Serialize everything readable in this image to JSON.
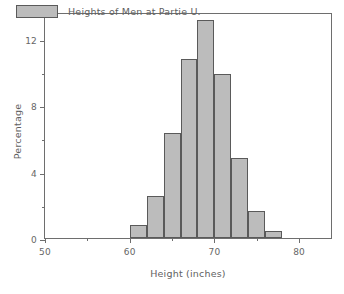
{
  "chart_data": {
    "type": "bar",
    "title": "",
    "subtitle": "",
    "xlabel": "Height (inches)",
    "ylabel": "Percentage",
    "xlim": [
      50,
      84
    ],
    "ylim": [
      0,
      13.6
    ],
    "grid": false,
    "legend_position": "top-left",
    "legend": [
      {
        "label": "Heights of Men at Partie U.",
        "color": "#bcbcbc"
      }
    ],
    "histogram": {
      "bin_width": 2,
      "bin_edges": [
        60,
        62,
        64,
        66,
        68,
        70,
        72,
        74,
        76,
        78
      ],
      "bin_centers": [
        61,
        63,
        65,
        67,
        69,
        71,
        73,
        75,
        77
      ]
    },
    "categories": [
      "60-62",
      "62-64",
      "64-66",
      "66-68",
      "68-70",
      "70-72",
      "72-74",
      "74-76",
      "76-78"
    ],
    "values": [
      0.8,
      2.5,
      6.3,
      10.8,
      13.1,
      9.9,
      4.8,
      1.6,
      0.4
    ],
    "x_ticks_major": [
      50,
      60,
      70,
      80
    ],
    "x_ticks_minor": [
      55,
      65,
      75
    ],
    "y_ticks_major": [
      0,
      4,
      8,
      12
    ],
    "y_ticks_minor": [
      2,
      6,
      10
    ],
    "colors": {
      "bar_fill": "#bcbcbc",
      "bar_edge": "#5a5a5a",
      "axis": "#6e6e6e",
      "text": "#5f5f5f",
      "background": "#ffffff"
    }
  }
}
